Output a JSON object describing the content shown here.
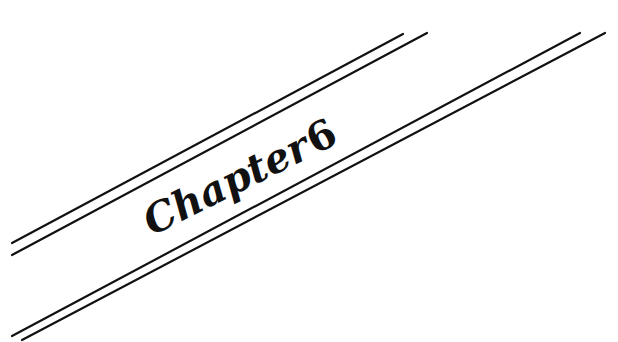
{
  "heading": {
    "label": "Chapter",
    "number": "6"
  },
  "colors": {
    "ink": "#111111",
    "background": "#ffffff"
  },
  "decoration": {
    "rule_pairs": 2,
    "angle_deg": -26.5
  }
}
